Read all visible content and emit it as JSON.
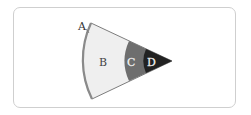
{
  "diagram": {
    "type": "sector-layers",
    "labels": {
      "a": "A",
      "b": "B",
      "c": "C",
      "d": "D"
    },
    "colors": {
      "outer_rim": "#8a8a8a",
      "layer_b": "#efefef",
      "layer_c": "#6e6e6e",
      "layer_d": "#222222",
      "frame_border": "#cfcfcf"
    }
  }
}
